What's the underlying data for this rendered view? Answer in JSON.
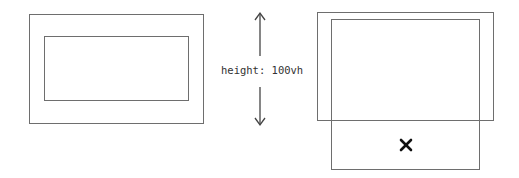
{
  "left_diagram": {
    "outer_box": {
      "x": 29,
      "y": 14,
      "w": 175,
      "h": 110
    },
    "inner_box": {
      "x": 44,
      "y": 36,
      "w": 145,
      "h": 65
    }
  },
  "middle": {
    "label": "height: 100vh",
    "arrow": {
      "x": 260,
      "top": 13,
      "bottom": 125,
      "gap_top": 56,
      "gap_bottom": 87
    }
  },
  "right_diagram": {
    "outer_box": {
      "x": 317,
      "y": 12,
      "w": 177,
      "h": 109
    },
    "inner_box": {
      "x": 331,
      "y": 19,
      "w": 149,
      "h": 151
    },
    "mark": {
      "symbol": "×",
      "meaning": "cross-icon",
      "x": 406,
      "y": 145
    }
  },
  "colors": {
    "stroke": "#6e6e6e",
    "text": "#333333",
    "mark": "#111111"
  }
}
